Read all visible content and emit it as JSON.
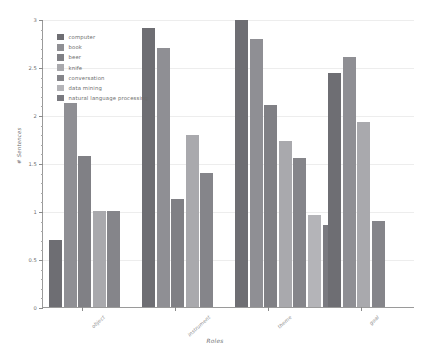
{
  "chart_data": {
    "type": "bar",
    "title": "",
    "xlabel": "Roles",
    "ylabel": "# Sentences",
    "categories": [
      "object",
      "instrument",
      "theme",
      "goal"
    ],
    "ylim": [
      0,
      3
    ],
    "yticks": [
      0,
      0.5,
      1,
      1.5,
      2,
      2.5,
      3
    ],
    "ytick_labels": [
      "0",
      "0.5",
      "1",
      "1.5",
      "2",
      "2.5",
      "3"
    ],
    "grid": true,
    "legend_position": "upper left",
    "series": [
      {
        "name": "computer",
        "color": "#6e6e73",
        "values": [
          0.7,
          2.91,
          2.99,
          2.44
        ]
      },
      {
        "name": "book",
        "color": "#8f8f94",
        "values": [
          2.12,
          2.7,
          2.79,
          2.6
        ]
      },
      {
        "name": "beer",
        "color": "#808085",
        "values": [
          1.57,
          1.12,
          2.1,
          null
        ]
      },
      {
        "name": "knife",
        "color": "#a9a9ad",
        "values": [
          1.0,
          1.79,
          1.73,
          1.93
        ]
      },
      {
        "name": "conversation",
        "color": "#85858a",
        "values": [
          1.0,
          1.4,
          1.55,
          0.9
        ]
      },
      {
        "name": "data mining",
        "color": "#b4b4b8",
        "values": [
          null,
          null,
          0.96,
          null
        ]
      },
      {
        "name": "natural language processing",
        "color": "#7a7a80",
        "values": [
          null,
          null,
          0.85,
          null
        ]
      }
    ]
  }
}
